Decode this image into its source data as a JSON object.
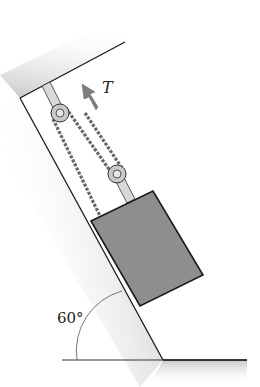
{
  "figure": {
    "force_label": "T",
    "angle_label": "60°",
    "angle_degrees": 60,
    "colors": {
      "background": "#ffffff",
      "wall_shade": "#bdbdbd",
      "line": "#1a1a1a",
      "block_fill": "#8e8e8e",
      "arrow_fill": "#7d7d7d",
      "pulley_fill": "#c9c9c9",
      "rod_fill": "#d9d9d9"
    }
  }
}
